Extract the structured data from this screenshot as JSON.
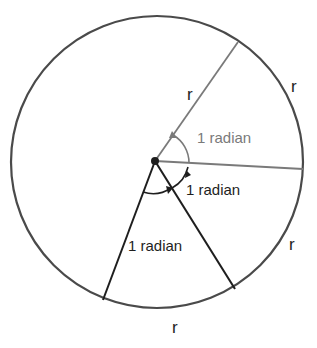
{
  "diagram": {
    "colors": {
      "circle": "#4a4a4a",
      "gray_line": "#7a7a7a",
      "black_line": "#1e1e1e",
      "gray_text": "#7a7a7a",
      "black_text": "#1e1e1e"
    },
    "labels": {
      "radius_upper": "r",
      "arc_upper_right": "r",
      "arc_lower_right": "r",
      "arc_bottom": "r",
      "angle_upper": "1 radian",
      "angle_middle": "1 radian",
      "angle_lower": "1 radian"
    }
  }
}
